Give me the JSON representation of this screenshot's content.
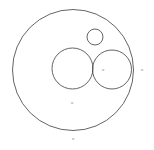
{
  "figure": {
    "background_color": "#ffffff",
    "stroke_color": "#3c3c3c",
    "label_color": "#6e6e6e",
    "canvas": {
      "width": 154,
      "height": 150
    }
  },
  "chart_data": {
    "type": "diagram",
    "subtitle": "",
    "xlabel": "",
    "ylabel": "",
    "grid": false,
    "legend": false,
    "units": "pixels",
    "xlim": [
      0,
      154
    ],
    "ylim": [
      0,
      150
    ],
    "shapes": [
      {
        "name": "outer-boundary-circle",
        "role": "boundary",
        "cx": 73,
        "cy": 70,
        "r": 60.5,
        "stroke": "#3c3c3c",
        "stroke_width": 0.8,
        "fill": "none"
      },
      {
        "name": "large-inner-circle",
        "role": "packed",
        "cx": 72.5,
        "cy": 68.5,
        "r": 20.5,
        "stroke": "#3c3c3c",
        "stroke_width": 0.8,
        "fill": "none"
      },
      {
        "name": "medium-inner-circle",
        "role": "packed",
        "cx": 112,
        "cy": 69.5,
        "r": 19.5,
        "stroke": "#3c3c3c",
        "stroke_width": 0.8,
        "fill": "none"
      },
      {
        "name": "small-inner-circle",
        "role": "packed",
        "cx": 95,
        "cy": 37,
        "r": 8,
        "stroke": "#3c3c3c",
        "stroke_width": 0.8,
        "fill": "none"
      }
    ],
    "point_labels": [
      {
        "name": "label-inner-tangency",
        "text": "o",
        "x": 103,
        "y": 70
      },
      {
        "name": "label-outer-right",
        "text": "o",
        "x": 142,
        "y": 70
      },
      {
        "name": "label-lower-center",
        "text": "o",
        "x": 72,
        "y": 103
      },
      {
        "name": "label-bottom",
        "text": "o",
        "x": 73,
        "y": 139
      }
    ]
  }
}
